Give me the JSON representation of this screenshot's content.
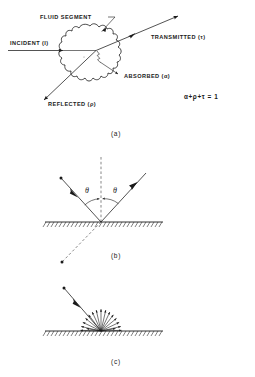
{
  "figure": {
    "title_text": "Radiation interaction with a fluid segment and surface reflection modes",
    "panels": [
      {
        "id": "a",
        "caption": "(a)",
        "labels": {
          "fluid_segment": "FLUID SEGMENT",
          "incident": "INCIDENT (I)",
          "transmitted": "TRANSMITTED (τ)",
          "absorbed": "ABSORBED (α)",
          "reflected": "REFLECTED (ρ)"
        },
        "equation": "α+ρ+τ = 1"
      },
      {
        "id": "b",
        "caption": "(b)",
        "angle_incidence": "θ",
        "angle_reflection": "θ",
        "description": "specular reflection"
      },
      {
        "id": "c",
        "caption": "(c)",
        "description": "diffuse reflection",
        "ray_count": 17
      }
    ],
    "colors": {
      "ink": "#1a1a1a",
      "dashed": "#555555",
      "background": "#ffffff"
    }
  }
}
